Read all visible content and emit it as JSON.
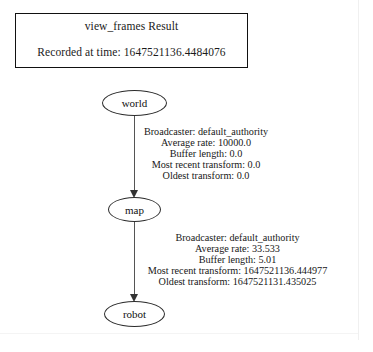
{
  "result_box": {
    "title": "view_frames Result",
    "recorded_label": "Recorded at time: 1647521136.4484076"
  },
  "graph": {
    "nodes": [
      {
        "id": "world",
        "label": "world"
      },
      {
        "id": "map",
        "label": "map"
      },
      {
        "id": "robot",
        "label": "robot"
      }
    ],
    "edges": [
      {
        "from": "world",
        "to": "map",
        "broadcaster": "Broadcaster: default_authority",
        "average_rate": "Average rate: 10000.0",
        "buffer_length": "Buffer length: 0.0",
        "most_recent_transform": "Most recent transform: 0.0",
        "oldest_transform": "Oldest transform: 0.0"
      },
      {
        "from": "map",
        "to": "robot",
        "broadcaster": "Broadcaster: default_authority",
        "average_rate": "Average rate: 33.533",
        "buffer_length": "Buffer length: 5.01",
        "most_recent_transform": "Most recent transform: 1647521136.444977",
        "oldest_transform": "Oldest transform: 1647521131.435025"
      }
    ]
  },
  "colors": {
    "background": "#ffffff",
    "text": "#1a1a1a",
    "box_border": "#111111",
    "node_border": "#2b2b2b",
    "edge": "#555555"
  }
}
